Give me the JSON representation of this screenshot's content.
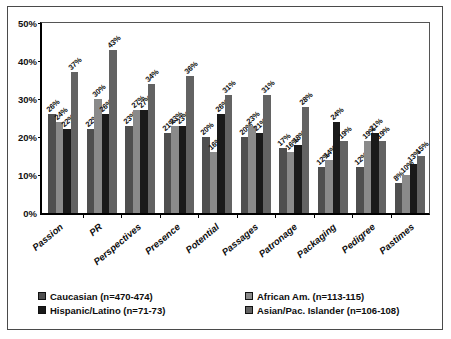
{
  "chart_data": {
    "type": "bar",
    "title": "",
    "xlabel": "",
    "ylabel": "",
    "ylim": [
      0,
      50
    ],
    "ytick_labels": [
      "0%",
      "10%",
      "20%",
      "30%",
      "40%",
      "50%"
    ],
    "ytick_values": [
      0,
      10,
      20,
      30,
      40,
      50
    ],
    "grid": false,
    "legend_position": "bottom",
    "value_label_suffix": "%",
    "categories": [
      "Passion",
      "PR",
      "Perspectives",
      "Presence",
      "Potential",
      "Passages",
      "Patronage",
      "Packaging",
      "Pedigree",
      "Pastimes"
    ],
    "series": [
      {
        "name": "Caucasian (n=470-474)",
        "color": "#4f4f4f",
        "values": [
          26,
          22,
          23,
          21,
          20,
          20,
          17,
          12,
          12,
          8
        ],
        "labels": [
          "26%",
          "22%",
          "23%",
          "21%",
          "20%",
          "20%",
          "17%",
          "12%",
          "12%",
          "8%"
        ]
      },
      {
        "name": "African Am. (n=113-115)",
        "color": "#8a8a8a",
        "values": [
          24,
          30,
          27,
          23,
          16,
          23,
          16,
          14,
          19,
          10
        ],
        "labels": [
          "24%",
          "30%",
          "27%",
          "23%",
          "16%",
          "23%",
          "16%",
          "14%",
          "19%",
          "10%"
        ]
      },
      {
        "name": "Hispanic/Latino (n=71-73)",
        "color": "#1a1a1a",
        "values": [
          22,
          26,
          27,
          23,
          26,
          21,
          18,
          24,
          21,
          13
        ],
        "labels": [
          "22%",
          "26%",
          "27%",
          "23%",
          "26%",
          "21%",
          "18%",
          "24%",
          "21%",
          "13%"
        ]
      },
      {
        "name": "Asian/Pac. Islander (n=106-108)",
        "color": "#636363",
        "values": [
          37,
          43,
          34,
          36,
          31,
          31,
          28,
          19,
          19,
          15
        ],
        "labels": [
          "37%",
          "43%",
          "34%",
          "36%",
          "31%",
          "31%",
          "28%",
          "19%",
          "19%",
          "15%"
        ]
      }
    ]
  },
  "legend": {
    "items": [
      {
        "label": "Caucasian (n=470-474)",
        "color": "#4f4f4f"
      },
      {
        "label": "African Am. (n=113-115)",
        "color": "#8a8a8a"
      },
      {
        "label": "Hispanic/Latino (n=71-73)",
        "color": "#1a1a1a"
      },
      {
        "label": "Asian/Pac. Islander (n=106-108)",
        "color": "#636363"
      }
    ]
  }
}
